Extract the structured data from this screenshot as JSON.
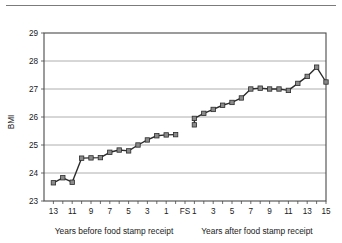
{
  "chart_data": {
    "type": "line",
    "title": "",
    "ylabel": "BMI",
    "xlabel_left": "Years before food stamp receipt",
    "xlabel_right": "Years after food stamp receipt",
    "ylim": [
      23,
      29
    ],
    "yticks": [
      23,
      24,
      25,
      26,
      27,
      28,
      29
    ],
    "ytick_labels": [
      "23",
      "24",
      "25",
      "26",
      "27",
      "28",
      "29"
    ],
    "grid": true,
    "legend": "none",
    "xtick_labels_left": [
      "13",
      "11",
      "9",
      "7",
      "5",
      "3",
      "1"
    ],
    "xtick_label_event": "FS",
    "xtick_labels_right": [
      "1",
      "3",
      "5",
      "7",
      "9",
      "11",
      "13",
      "15"
    ],
    "marker_color": "#8a8a8a",
    "line_color": "#2b2b2b",
    "grid_color": "#9a9a9a",
    "series": [
      {
        "name": "Years before food stamp receipt",
        "x": [
          13,
          12,
          11,
          10,
          9,
          8,
          7,
          6,
          5,
          4,
          3,
          2,
          1,
          0
        ],
        "values": [
          23.65,
          23.83,
          23.67,
          24.53,
          24.54,
          24.55,
          24.74,
          24.82,
          24.79,
          25.0,
          25.18,
          25.33,
          25.36,
          25.37
        ]
      },
      {
        "name": "Years after food stamp receipt",
        "x": [
          0.5,
          1,
          2,
          3,
          4,
          5,
          6,
          7,
          8,
          9,
          10,
          11,
          12,
          13,
          14,
          15
        ],
        "values": [
          25.72,
          25.95,
          26.13,
          26.27,
          26.42,
          26.52,
          26.68,
          27.0,
          27.03,
          27.0,
          27.0,
          26.95,
          27.2,
          27.45,
          27.78,
          27.25
        ]
      }
    ]
  }
}
